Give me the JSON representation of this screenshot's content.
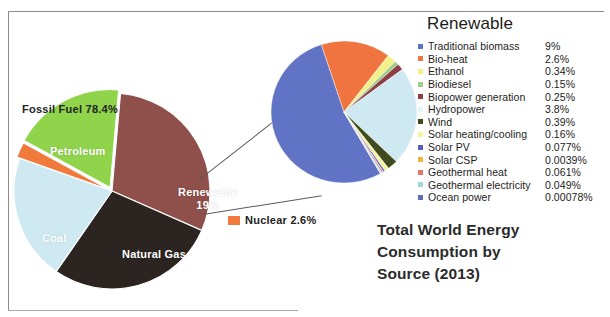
{
  "chart_data": {
    "type": "pie",
    "title": "Total World Energy Consumption by Source (2013)",
    "legend_title": "Renewable",
    "legend_position": "right",
    "main_pie": {
      "name": "World energy consumption by source",
      "categories": [
        "Petroleum",
        "Coal",
        "Natural Gas",
        "Nuclear",
        "Renewable"
      ],
      "values": [
        31.1,
        28.9,
        21.4,
        2.6,
        19.0
      ],
      "colors": [
        "#8f4f4a",
        "#2b2420",
        "#cfe9f2",
        "#f07a3c",
        "#8fd44a"
      ],
      "slice_labels": [
        {
          "label": "Petroleum",
          "inside": true
        },
        {
          "label": "Coal",
          "inside": true
        },
        {
          "label": "Natural Gas",
          "inside": true
        },
        {
          "label": "Nuclear 2.6%",
          "inside": false
        },
        {
          "label": "Renewable",
          "sublabel": "19%",
          "inside": true
        }
      ],
      "annotations": [
        {
          "text": "Fossil Fuel  78.4%",
          "refers_to": [
            "Petroleum",
            "Coal",
            "Natural Gas"
          ]
        }
      ]
    },
    "secondary_pie": {
      "name": "Renewable breakdown",
      "note": "Exploded detail of the Renewable slice (19% of total)",
      "categories": [
        "Traditional biomass",
        "Bio-heat",
        "Ethanol",
        "Biodiesel",
        "Biopower generation",
        "Hydropower",
        "Wind",
        "Solar heating/cooling",
        "Solar PV",
        "Solar CSP",
        "Geothermal heat",
        "Geothermal electricity",
        "Ocean power"
      ],
      "values": [
        9,
        2.6,
        0.34,
        0.15,
        0.25,
        3.8,
        0.39,
        0.16,
        0.077,
        0.0039,
        0.061,
        0.049,
        0.00078
      ],
      "unit": "% of total world energy",
      "colors": [
        "#6073c4",
        "#f0743f",
        "#f5ef8a",
        "#9ccf86",
        "#8d3f47",
        "#cfe9f2",
        "#3f4a1e",
        "#f7f2a0",
        "#5a5fbe",
        "#f0b43c",
        "#e0796b",
        "#9fd7e0",
        "#5b6bb5"
      ]
    }
  },
  "figure": {
    "fossil_fuel_annotation": "Fossil Fuel  78.4%",
    "nuclear_annotation": "Nuclear 2.6%",
    "petroleum_label": "Petroleum",
    "coal_label": "Coal",
    "natural_gas_label": "Natural Gas",
    "renewable_label": "Renewable",
    "renewable_percent": "19%",
    "title_line_1": "Total World Energy",
    "title_line_2": "Consumption by",
    "title_line_3": "Source (2013)"
  },
  "legend": {
    "title": "Renewable",
    "items": [
      {
        "label": "Traditional biomass",
        "value": "9%",
        "color": "#6073c4"
      },
      {
        "label": "Bio-heat",
        "value": "2.6%",
        "color": "#f0743f"
      },
      {
        "label": "Ethanol",
        "value": "0.34%",
        "color": "#f5ef8a"
      },
      {
        "label": "Biodiesel",
        "value": "0.15%",
        "color": "#9ccf86"
      },
      {
        "label": "Biopower generation",
        "value": "0.25%",
        "color": "#8d3f47"
      },
      {
        "label": "Hydropower",
        "value": "3.8%",
        "color": "#e8f4f8"
      },
      {
        "label": "Wind",
        "value": "0.39%",
        "color": "#3f4a1e"
      },
      {
        "label": "Solar heating/cooling",
        "value": "0.16%",
        "color": "#f7f2a0"
      },
      {
        "label": "Solar PV",
        "value": "0.077%",
        "color": "#5a5fbe"
      },
      {
        "label": "Solar CSP",
        "value": "0.0039%",
        "color": "#f0b43c"
      },
      {
        "label": "Geothermal heat",
        "value": "0.061%",
        "color": "#e0796b"
      },
      {
        "label": "Geothermal electricity",
        "value": "0.049%",
        "color": "#9fd7e0"
      },
      {
        "label": "Ocean power",
        "value": "0.00078%",
        "color": "#5b6bb5"
      }
    ]
  }
}
